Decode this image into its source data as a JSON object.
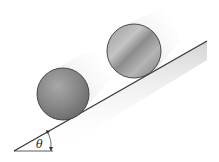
{
  "diagram": {
    "type": "physics-incline",
    "angle_label": "θ",
    "colors": {
      "background": "#ffffff",
      "incline_line": "#333333",
      "object_fill": "#8a8a8a",
      "object_outline": "#3a3a3a",
      "shadow": "#d8d8d8"
    },
    "objects": [
      {
        "name": "sphere",
        "cx": 63,
        "cy": 94,
        "r": 26
      },
      {
        "name": "disk",
        "cx": 134,
        "cy": 51,
        "r": 27
      }
    ],
    "incline": {
      "x1": 14,
      "y1": 151,
      "x2": 207,
      "y2": 41
    },
    "baseline": {
      "x1": 14,
      "y1": 151,
      "x2": 53,
      "y2": 151
    }
  }
}
